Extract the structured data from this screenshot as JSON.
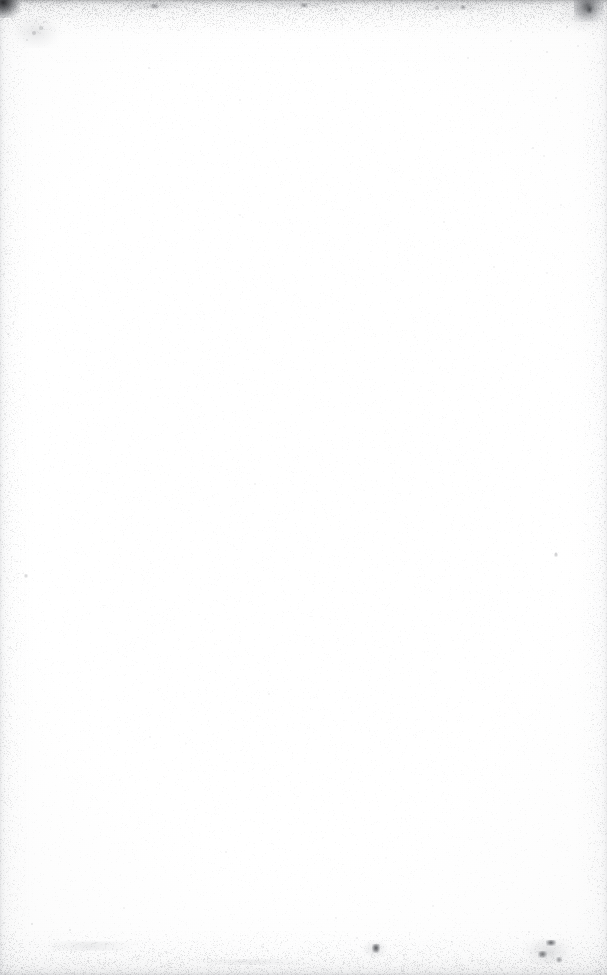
{
  "document": {
    "kind": "scanned-page",
    "page_content": "blank",
    "visible_text": "",
    "page_width_px": 607,
    "page_height_px": 975,
    "paper_color": "#fdfdfd",
    "center_color": "#ffffff",
    "ink_color": "#1c1d20",
    "notes_rendered_on_screen": "no text, headings, figures, page numbers, or UI chrome are present in the pixels"
  },
  "artifacts": {
    "edges": [
      {
        "name": "top-edge-shadow",
        "side": "top",
        "thickness_px": 64,
        "peak_color": "#6e7073",
        "peak_opacity": 0.5
      },
      {
        "name": "bottom-edge-shadow",
        "side": "bottom",
        "thickness_px": 58,
        "peak_color": "#96989c",
        "peak_opacity": 0.3
      },
      {
        "name": "left-edge-shadow",
        "side": "left",
        "thickness_px": 34,
        "peak_color": "#a8aaaf",
        "peak_opacity": 0.26
      },
      {
        "name": "right-edge-shadow",
        "side": "right",
        "thickness_px": 32,
        "peak_color": "#acaeb3",
        "peak_opacity": 0.22
      }
    ],
    "corner_blots": [
      {
        "name": "top-left-corner-blot",
        "x": -6,
        "y": -6,
        "w": 26,
        "h": 24,
        "color": "#1c1d20",
        "opacity": 0.92
      },
      {
        "name": "top-right-corner-blot",
        "x": 574,
        "y": -4,
        "w": 30,
        "h": 26,
        "color": "#34363a",
        "opacity": 0.72
      }
    ],
    "dark_blots": [
      {
        "name": "bottom-center-ink-blot",
        "x": 372,
        "y": 944,
        "w": 8,
        "h": 9,
        "opacity": 0.88
      },
      {
        "name": "bottom-right-ink-cluster-a",
        "x": 546,
        "y": 940,
        "w": 10,
        "h": 6,
        "opacity": 0.78
      },
      {
        "name": "bottom-right-ink-cluster-b",
        "x": 538,
        "y": 951,
        "w": 9,
        "h": 7,
        "opacity": 0.7
      },
      {
        "name": "bottom-right-ink-cluster-c",
        "x": 556,
        "y": 957,
        "w": 6,
        "h": 6,
        "opacity": 0.52
      },
      {
        "name": "top-right-ink-fleck",
        "x": 586,
        "y": 6,
        "w": 7,
        "h": 8,
        "opacity": 0.66
      },
      {
        "name": "top-mid-ink-fleck",
        "x": 300,
        "y": 3,
        "w": 8,
        "h": 5,
        "opacity": 0.46
      },
      {
        "name": "top-left-ink-fleck",
        "x": 150,
        "y": 4,
        "w": 9,
        "h": 5,
        "opacity": 0.42
      },
      {
        "name": "top-band-fleck-a",
        "x": 460,
        "y": 5,
        "w": 6,
        "h": 5,
        "opacity": 0.4
      },
      {
        "name": "mid-right-dust-speck",
        "x": 554,
        "y": 553,
        "w": 4,
        "h": 4,
        "opacity": 0.3
      },
      {
        "name": "left-mid-dust-speck",
        "x": 24,
        "y": 574,
        "w": 4,
        "h": 4,
        "opacity": 0.26
      }
    ],
    "dust_specks": [
      {
        "x": 34,
        "y": 33,
        "r": 2.0,
        "o": 0.22
      },
      {
        "x": 41,
        "y": 28,
        "r": 1.6,
        "o": 0.18
      },
      {
        "x": 27,
        "y": 40,
        "r": 1.4,
        "o": 0.16
      },
      {
        "x": 44,
        "y": 22,
        "r": 1.2,
        "o": 0.14
      },
      {
        "x": 96,
        "y": 14,
        "r": 1.3,
        "o": 0.16
      },
      {
        "x": 131,
        "y": 10,
        "r": 1.5,
        "o": 0.2
      },
      {
        "x": 196,
        "y": 12,
        "r": 1.2,
        "o": 0.14
      },
      {
        "x": 242,
        "y": 7,
        "r": 1.4,
        "o": 0.17
      },
      {
        "x": 289,
        "y": 16,
        "r": 1.1,
        "o": 0.12
      },
      {
        "x": 336,
        "y": 9,
        "r": 1.5,
        "o": 0.19
      },
      {
        "x": 391,
        "y": 14,
        "r": 1.2,
        "o": 0.13
      },
      {
        "x": 437,
        "y": 8,
        "r": 1.6,
        "o": 0.21
      },
      {
        "x": 472,
        "y": 18,
        "r": 1.2,
        "o": 0.14
      },
      {
        "x": 497,
        "y": 12,
        "r": 1.3,
        "o": 0.15
      },
      {
        "x": 521,
        "y": 24,
        "r": 1.4,
        "o": 0.16
      },
      {
        "x": 567,
        "y": 27,
        "r": 1.3,
        "o": 0.15
      },
      {
        "x": 593,
        "y": 34,
        "r": 1.2,
        "o": 0.14
      },
      {
        "x": 578,
        "y": 46,
        "r": 1.1,
        "o": 0.11
      },
      {
        "x": 547,
        "y": 52,
        "r": 1.2,
        "o": 0.12
      },
      {
        "x": 511,
        "y": 41,
        "r": 1.0,
        "o": 0.1
      },
      {
        "x": 468,
        "y": 58,
        "r": 1.1,
        "o": 0.1
      },
      {
        "x": 149,
        "y": 68,
        "r": 1.2,
        "o": 0.11
      },
      {
        "x": 240,
        "y": 100,
        "r": 1.0,
        "o": 0.09
      },
      {
        "x": 556,
        "y": 98,
        "r": 1.1,
        "o": 0.1
      },
      {
        "x": 533,
        "y": 148,
        "r": 1.2,
        "o": 0.11
      },
      {
        "x": 8,
        "y": 152,
        "r": 1.2,
        "o": 0.13
      },
      {
        "x": 544,
        "y": 156,
        "r": 1.0,
        "o": 0.09
      },
      {
        "x": 5,
        "y": 190,
        "r": 1.1,
        "o": 0.12
      },
      {
        "x": 444,
        "y": 222,
        "r": 1.1,
        "o": 0.09
      },
      {
        "x": 561,
        "y": 205,
        "r": 1.0,
        "o": 0.08
      },
      {
        "x": 6,
        "y": 254,
        "r": 1.1,
        "o": 0.12
      },
      {
        "x": 240,
        "y": 215,
        "r": 1.0,
        "o": 0.08
      },
      {
        "x": 8,
        "y": 334,
        "r": 1.3,
        "o": 0.14
      },
      {
        "x": 547,
        "y": 273,
        "r": 1.0,
        "o": 0.08
      },
      {
        "x": 494,
        "y": 267,
        "r": 1.1,
        "o": 0.09
      },
      {
        "x": 5,
        "y": 414,
        "r": 1.3,
        "o": 0.15
      },
      {
        "x": 6,
        "y": 446,
        "r": 1.1,
        "o": 0.12
      },
      {
        "x": 255,
        "y": 484,
        "r": 1.1,
        "o": 0.09
      },
      {
        "x": 9,
        "y": 492,
        "r": 1.2,
        "o": 0.12
      },
      {
        "x": 269,
        "y": 694,
        "r": 1.1,
        "o": 0.09
      },
      {
        "x": 7,
        "y": 578,
        "r": 1.2,
        "o": 0.13
      },
      {
        "x": 150,
        "y": 737,
        "r": 1.0,
        "o": 0.08
      },
      {
        "x": 556,
        "y": 553,
        "r": 1.2,
        "o": 0.12
      },
      {
        "x": 10,
        "y": 648,
        "r": 1.1,
        "o": 0.11
      },
      {
        "x": 226,
        "y": 852,
        "r": 1.1,
        "o": 0.09
      },
      {
        "x": 32,
        "y": 924,
        "r": 1.4,
        "o": 0.16
      },
      {
        "x": 70,
        "y": 930,
        "r": 1.3,
        "o": 0.15
      },
      {
        "x": 106,
        "y": 944,
        "r": 1.2,
        "o": 0.13
      },
      {
        "x": 166,
        "y": 952,
        "r": 1.2,
        "o": 0.12
      },
      {
        "x": 208,
        "y": 958,
        "r": 1.3,
        "o": 0.14
      },
      {
        "x": 263,
        "y": 947,
        "r": 1.1,
        "o": 0.11
      },
      {
        "x": 312,
        "y": 960,
        "r": 1.2,
        "o": 0.12
      },
      {
        "x": 357,
        "y": 938,
        "r": 1.1,
        "o": 0.11
      },
      {
        "x": 404,
        "y": 955,
        "r": 1.2,
        "o": 0.12
      },
      {
        "x": 452,
        "y": 942,
        "r": 1.1,
        "o": 0.11
      },
      {
        "x": 500,
        "y": 962,
        "r": 1.2,
        "o": 0.12
      },
      {
        "x": 529,
        "y": 932,
        "r": 1.1,
        "o": 0.11
      },
      {
        "x": 573,
        "y": 948,
        "r": 1.3,
        "o": 0.16
      },
      {
        "x": 596,
        "y": 962,
        "r": 1.2,
        "o": 0.14
      },
      {
        "x": 22,
        "y": 968,
        "r": 1.3,
        "o": 0.15
      },
      {
        "x": 124,
        "y": 908,
        "r": 1.0,
        "o": 0.09
      },
      {
        "x": 336,
        "y": 918,
        "r": 1.0,
        "o": 0.08
      },
      {
        "x": 433,
        "y": 906,
        "r": 1.0,
        "o": 0.08
      }
    ]
  }
}
